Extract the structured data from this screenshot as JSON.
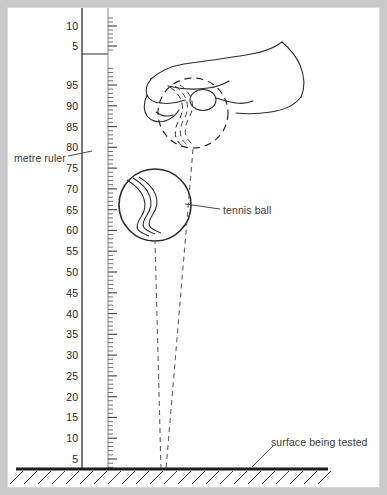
{
  "diagram": {
    "background_color": "#c9c9c9",
    "paper_color": "#ffffff",
    "ink_color": "#2b2b2b",
    "labels": {
      "metre_ruler": "metre ruler",
      "tennis_ball": "tennis ball",
      "surface_being_tested": "surface being tested"
    },
    "ruler": {
      "name": "metre ruler",
      "scale_units": "cm",
      "major_tick_interval": 5,
      "minor_tick_interval": 1,
      "lower_section_labels": [
        5,
        10,
        15,
        20,
        25,
        30,
        35,
        40,
        45,
        50,
        55,
        60,
        65,
        70,
        75,
        80,
        85,
        90,
        95
      ],
      "upper_section_labels": [
        5,
        10
      ],
      "break_present": true
    },
    "objects": {
      "hand": {
        "name": "hand holding ball",
        "ball_outline_style": "dashed"
      },
      "ball": {
        "name": "tennis ball",
        "style": "solid outline with seam"
      },
      "drop_path": {
        "name": "dashed trajectory lines",
        "style": "dashed"
      },
      "surface": {
        "name": "surface being tested",
        "style": "solid line with hatching"
      }
    }
  }
}
